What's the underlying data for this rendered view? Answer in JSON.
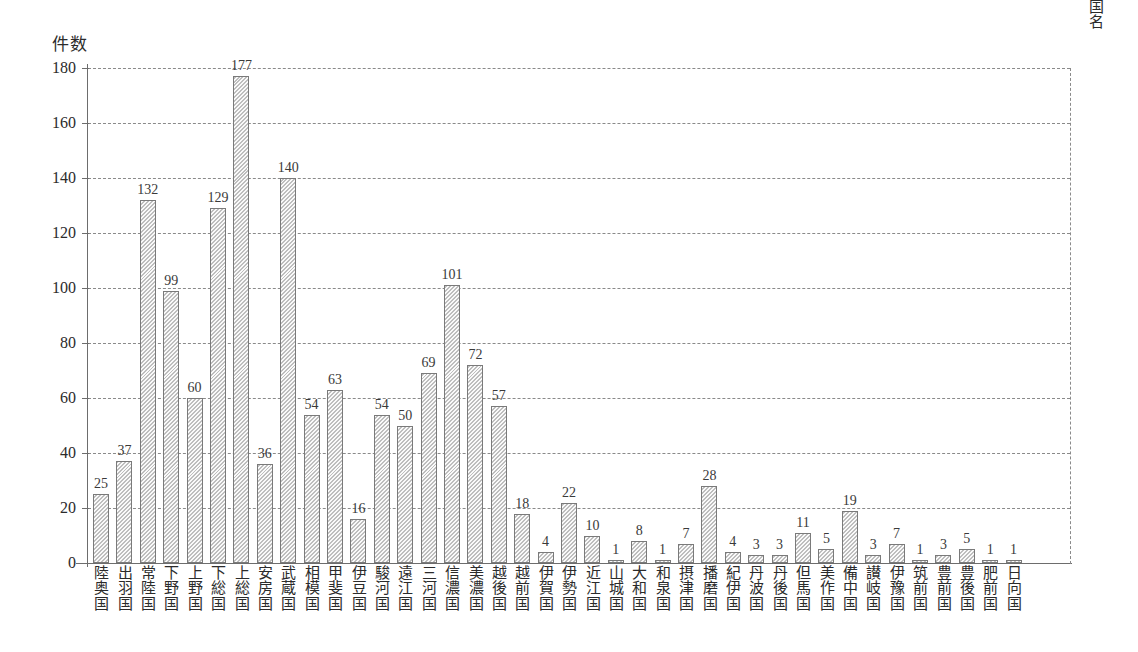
{
  "chart_data": {
    "type": "bar",
    "title": "",
    "ylabel": "件数",
    "xlabel": "国名",
    "ylim": [
      0,
      180
    ],
    "ytick_values": [
      0,
      20,
      40,
      60,
      80,
      100,
      120,
      140,
      160,
      180
    ],
    "grid": true,
    "legend": "none",
    "categories": [
      "陸奥国",
      "出羽国",
      "常陸国",
      "下野国",
      "上野国",
      "下総国",
      "上総国",
      "安房国",
      "武蔵国",
      "相模国",
      "甲斐国",
      "伊豆国",
      "駿河国",
      "遠江国",
      "三河国",
      "信濃国",
      "美濃国",
      "越後国",
      "越前国",
      "伊賀国",
      "伊勢国",
      "近江国",
      "山城国",
      "大和国",
      "和泉国",
      "摂津国",
      "播磨国",
      "紀伊国",
      "丹波国",
      "丹後国",
      "但馬国",
      "美作国",
      "備中国",
      "讃岐国",
      "伊豫国",
      "筑前国",
      "豊前国",
      "豊後国",
      "肥前国",
      "日向国"
    ],
    "values": [
      25,
      37,
      132,
      99,
      60,
      129,
      177,
      36,
      140,
      54,
      63,
      16,
      54,
      50,
      69,
      101,
      72,
      57,
      18,
      4,
      22,
      10,
      1,
      8,
      1,
      7,
      28,
      4,
      3,
      3,
      11,
      5,
      19,
      3,
      7,
      1,
      3,
      5,
      1,
      1
    ]
  },
  "style": {
    "bar_fill": "#dcdcdc",
    "bar_border": "#7a7a7a",
    "axis_color": "#6d6d6d",
    "grid_color": "#8a8a8a",
    "text_color": "#2b2b2b"
  }
}
